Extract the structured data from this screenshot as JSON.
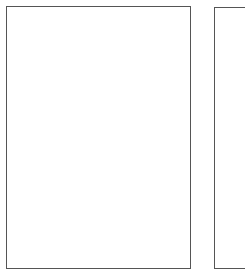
{
  "viewer": {
    "background_color": "#ffffff",
    "pages": [
      {
        "index": 1,
        "border_color": "#555555",
        "fill_color": "#ffffff",
        "content": ""
      },
      {
        "index": 2,
        "border_color": "#555555",
        "fill_color": "#ffffff",
        "content": ""
      }
    ]
  }
}
